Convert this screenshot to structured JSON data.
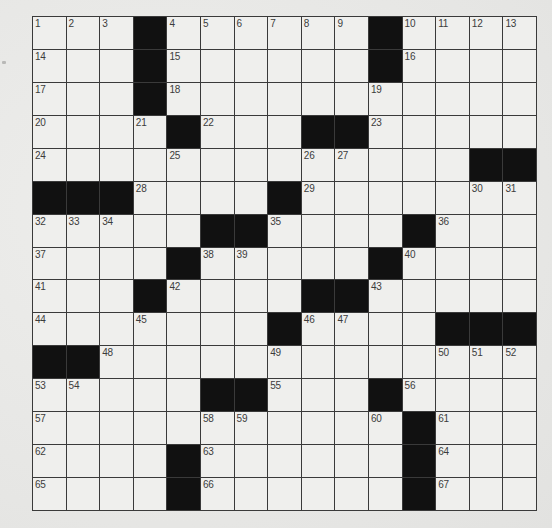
{
  "puzzle": {
    "type": "crossword",
    "size": {
      "rows": 15,
      "cols": 15
    },
    "colors": {
      "background": "#e9e9e7",
      "cell": "#efefed",
      "block": "#111111",
      "line": "#3a3a3a",
      "number": "#3c3c3c"
    },
    "grid": [
      [
        "1",
        "2",
        "3",
        "#",
        "4",
        "5",
        "6",
        "7",
        "8",
        "9",
        "#",
        "10",
        "11",
        "12",
        "13"
      ],
      [
        "14",
        "",
        "",
        "#",
        "15",
        "",
        "",
        "",
        "",
        "",
        "#",
        "16",
        "",
        "",
        ""
      ],
      [
        "17",
        "",
        "",
        "#",
        "18",
        "",
        "",
        "",
        "",
        "",
        "19",
        "",
        "",
        "",
        ""
      ],
      [
        "20",
        "",
        "",
        "21",
        "#",
        "22",
        "",
        "",
        "#",
        "#",
        "23",
        "",
        "",
        "",
        ""
      ],
      [
        "24",
        "",
        "",
        "",
        "25",
        "",
        "",
        "",
        "26",
        "27",
        "",
        "",
        "",
        "#",
        "#"
      ],
      [
        "#",
        "#",
        "#",
        "28",
        "",
        "",
        "",
        "#",
        "29",
        "",
        "",
        "",
        "",
        "30",
        "31"
      ],
      [
        "32",
        "33",
        "34",
        "",
        "",
        "#",
        "#",
        "35",
        "",
        "",
        "",
        "#",
        "36",
        "",
        ""
      ],
      [
        "37",
        "",
        "",
        "",
        "#",
        "38",
        "39",
        "",
        "",
        "",
        "#",
        "40",
        "",
        "",
        ""
      ],
      [
        "41",
        "",
        "",
        "#",
        "42",
        "",
        "",
        "",
        "#",
        "#",
        "43",
        "",
        "",
        "",
        ""
      ],
      [
        "44",
        "",
        "",
        "45",
        "",
        "",
        "",
        "#",
        "46",
        "47",
        "",
        "",
        "#",
        "#",
        "#"
      ],
      [
        "#",
        "#",
        "48",
        "",
        "",
        "",
        "",
        "49",
        "",
        "",
        "",
        "",
        "50",
        "51",
        "52"
      ],
      [
        "53",
        "54",
        "",
        "",
        "",
        "#",
        "#",
        "55",
        "",
        "",
        "#",
        "56",
        "",
        "",
        ""
      ],
      [
        "57",
        "",
        "",
        "",
        "",
        "58",
        "59",
        "",
        "",
        "",
        "60",
        "#",
        "61",
        "",
        ""
      ],
      [
        "62",
        "",
        "",
        "",
        "#",
        "63",
        "",
        "",
        "",
        "",
        "",
        "#",
        "64",
        "",
        ""
      ],
      [
        "65",
        "",
        "",
        "",
        "#",
        "66",
        "",
        "",
        "",
        "",
        "",
        "#",
        "67",
        "",
        ""
      ]
    ]
  }
}
